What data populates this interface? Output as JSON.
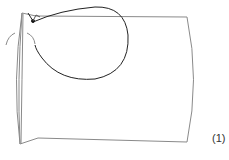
{
  "figure": {
    "label": "(1)",
    "colors": {
      "outline": "#8a8a8a",
      "thread": "#222222",
      "background": "#ffffff"
    }
  }
}
